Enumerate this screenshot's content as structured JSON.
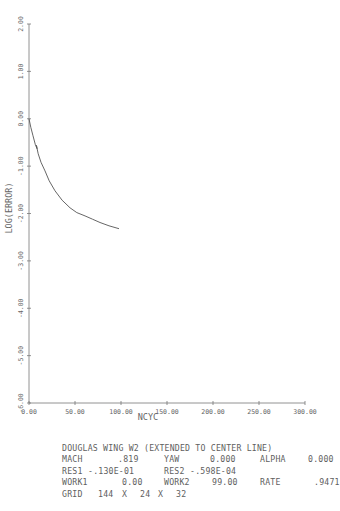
{
  "chart_data": {
    "type": "line",
    "title": "",
    "xlabel": "NCYC",
    "ylabel": "LOG(ERROR)",
    "xlim": [
      0,
      300
    ],
    "ylim": [
      -6,
      2
    ],
    "grid": false,
    "legend": null,
    "x_ticks": [
      0,
      50,
      100,
      150,
      200,
      250,
      300
    ],
    "x_tick_labels": [
      "0.00",
      "50.00",
      "100.00",
      "150.00",
      "200.00",
      "250.00",
      "300.00"
    ],
    "y_ticks": [
      2,
      1,
      0,
      -1,
      -2,
      -3,
      -4,
      -5,
      -6
    ],
    "y_tick_labels": [
      "2.00",
      "1.00",
      "0.00",
      "-1.00",
      "-2.00",
      "-3.00",
      "-4.00",
      "-5.00",
      "-6.00"
    ],
    "series": [
      {
        "name": "convergence history",
        "x": [
          0,
          2,
          4.3,
          7,
          8.7,
          8.0,
          10,
          13,
          17.4,
          22,
          28.3,
          36,
          44.6,
          52,
          60.9,
          69,
          77.2,
          87,
          97.8
        ],
        "y": [
          0,
          -0.18,
          -0.36,
          -0.55,
          -0.63,
          -0.56,
          -0.74,
          -0.92,
          -1.1,
          -1.31,
          -1.52,
          -1.72,
          -1.88,
          -1.98,
          -2.05,
          -2.12,
          -2.19,
          -2.26,
          -2.32
        ]
      }
    ]
  },
  "info": {
    "title": "DOUGLAS WING W2 (EXTENDED TO CENTER LINE)",
    "row1": {
      "mach_label": "MACH",
      "mach_value": ".819",
      "yaw_label": "YAW",
      "yaw_value": "0.000",
      "alpha_label": "ALPHA",
      "alpha_value": "0.000"
    },
    "row2": {
      "res1_label": "RES1",
      "res1_value": "-.130E-01",
      "res2_label": "RES2",
      "res2_value": "-.598E-04"
    },
    "row3": {
      "work1_label": "WORK1",
      "work1_value": "0.00",
      "work2_label": "WORK2",
      "work2_value": "99.00",
      "rate_label": "RATE",
      "rate_value": ".9471"
    },
    "row4": {
      "grid_label": "GRID",
      "grid_i": "144",
      "x1": "X",
      "grid_j": "24",
      "x2": "X",
      "grid_k": "32"
    }
  }
}
